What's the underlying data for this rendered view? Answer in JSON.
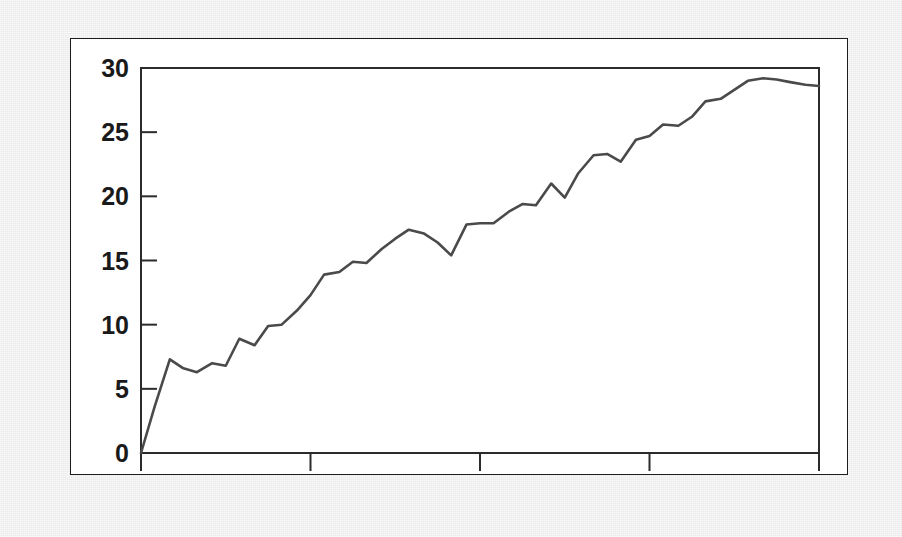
{
  "figure": {
    "background_color": "#e9e9e9",
    "panel_color": "#ffffff",
    "panel_border_color": "#1d1d1d"
  },
  "chart_data": {
    "type": "line",
    "title": "",
    "subtitle": "",
    "xlabel": "",
    "ylabel": "",
    "xlim": [
      1986,
      1990
    ],
    "ylim": [
      0,
      30
    ],
    "grid": false,
    "legend": null,
    "line_color": "#4a4a4a",
    "axis_color": "#2b2b2b",
    "xticks": [
      1986,
      1987,
      1988,
      1989,
      1990
    ],
    "xtick_labels": [
      "1986",
      "1987",
      "1988",
      "1989",
      "1990"
    ],
    "yticks": [
      0,
      5,
      10,
      15,
      20,
      25,
      30
    ],
    "ytick_labels": [
      "0",
      "5",
      "10",
      "15",
      "20",
      "25",
      "30"
    ],
    "series": [
      {
        "name": "series-1",
        "x": [
          1986.0,
          1986.08,
          1986.17,
          1986.25,
          1986.33,
          1986.42,
          1986.5,
          1986.58,
          1986.67,
          1986.75,
          1986.83,
          1986.92,
          1987.0,
          1987.08,
          1987.17,
          1987.25,
          1987.33,
          1987.42,
          1987.5,
          1987.58,
          1987.67,
          1987.75,
          1987.83,
          1987.92,
          1988.0,
          1988.08,
          1988.17,
          1988.25,
          1988.33,
          1988.42,
          1988.5,
          1988.58,
          1988.67,
          1988.75,
          1988.83,
          1988.92,
          1989.0,
          1989.08,
          1989.17,
          1989.25,
          1989.33,
          1989.42,
          1989.5,
          1989.58,
          1989.67,
          1989.75,
          1989.83,
          1989.92,
          1990.0
        ],
        "y": [
          0.0,
          3.6,
          7.3,
          6.6,
          6.3,
          7.0,
          6.8,
          8.9,
          8.4,
          9.9,
          10.0,
          11.1,
          12.3,
          13.9,
          14.1,
          14.9,
          14.8,
          15.9,
          16.7,
          17.4,
          17.1,
          16.4,
          15.4,
          17.8,
          17.9,
          17.9,
          18.8,
          19.4,
          19.3,
          21.0,
          19.9,
          21.8,
          23.2,
          23.3,
          22.7,
          24.4,
          24.7,
          25.6,
          25.5,
          26.2,
          27.4,
          27.6,
          28.3,
          29.0,
          29.2,
          29.1,
          28.9,
          28.7,
          28.6
        ]
      }
    ]
  }
}
